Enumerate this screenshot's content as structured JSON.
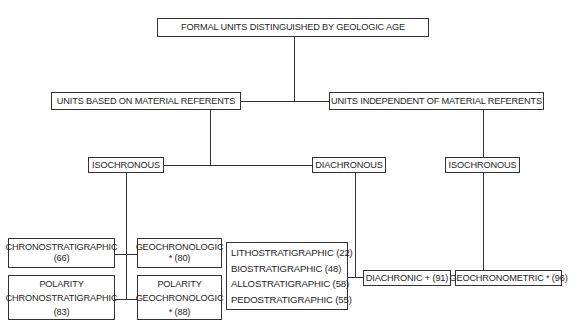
{
  "diagram": {
    "root": {
      "label": "FORMAL UNITS DISTINGUISHED BY GEOLOGIC AGE"
    },
    "level1": [
      {
        "label": "UNITS BASED ON MATERIAL REFERENTS"
      },
      {
        "label": "UNITS INDEPENDENT OF MATERIAL REFERENTS"
      }
    ],
    "level2": [
      {
        "label": "ISOCHRONOUS"
      },
      {
        "label": "DIACHRONOUS"
      },
      {
        "label": "ISOCHRONOUS"
      }
    ],
    "leaves": {
      "chronostratigraphic": {
        "line1": "CHRONOSTRATIGRAPHIC",
        "line2": "(66)"
      },
      "geochronologic": {
        "line1": "GEOCHRONOLOGIC",
        "line2": "* (80)"
      },
      "polarity_chronostratigraphic": {
        "line1": "POLARITY",
        "line2": "CHRONOSTRATIGRAPHIC",
        "line3": "(83)"
      },
      "polarity_geochronologic": {
        "line1": "POLARITY",
        "line2": "GEOCHRONOLOGIC",
        "line3": "* (88)"
      },
      "material_diachronous_list": [
        "LITHOSTRATIGRAPHIC (22)",
        "BIOSTRATIGRAPHIC (48)",
        "ALLOSTRATIGRAPHIC (58)",
        "PEDOSTRATIGRAPHIC (55)"
      ],
      "diachronic": {
        "label": "DIACHRONIC + (91)"
      },
      "geochronometric": {
        "label": "GEOCHRONOMETRIC * (96)"
      }
    },
    "colors": {
      "line": "#333333",
      "text": "#1e1e1e",
      "background": "#ffffff"
    }
  }
}
